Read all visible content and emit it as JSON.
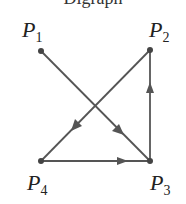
{
  "title": "Digraph",
  "nodes": [
    {
      "id": "P1",
      "label": "P",
      "sub": "1",
      "x": 41,
      "y": 51
    },
    {
      "id": "P2",
      "label": "P",
      "sub": "2",
      "x": 150,
      "y": 50
    },
    {
      "id": "P3",
      "label": "P",
      "sub": "3",
      "x": 150,
      "y": 161
    },
    {
      "id": "P4",
      "label": "P",
      "sub": "4",
      "x": 41,
      "y": 161
    }
  ],
  "edges": [
    {
      "from": "P1",
      "to": "P3"
    },
    {
      "from": "P2",
      "to": "P4"
    },
    {
      "from": "P4",
      "to": "P3"
    },
    {
      "from": "P3",
      "to": "P2"
    }
  ],
  "colors": {
    "edge": "#555555",
    "node": "#444444"
  }
}
